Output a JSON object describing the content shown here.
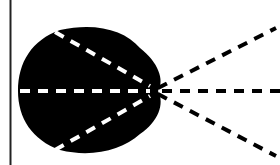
{
  "diagram": {
    "kind": "beam-spread",
    "description": "Black rounded lobe with three white dashed rays converging to a point, continuing as three black dashed rays fanning out to the right; vertical boundary line at left.",
    "colors": {
      "background": "#ffffff",
      "lobe_fill": "#000000",
      "inner_rays": "#ffffff",
      "outer_rays": "#000000",
      "boundary_line": "#222222"
    },
    "boundary_line": {
      "x": 10.5,
      "y1": 0,
      "y2": 165,
      "width": 2
    },
    "focus_point": {
      "x": 155,
      "y": 91
    },
    "lobe": {
      "path": "M 60 30 C 95 22, 125 30, 140 48 C 158 62, 165 80, 158 91 C 165 104, 158 122, 140 134 C 122 150, 92 158, 60 150 C 32 140, 18 118, 18 91 C 18 62, 32 40, 60 30 Z"
    },
    "inner_rays": [
      {
        "name": "inner-ray-upper",
        "x1": 55,
        "y1": 32,
        "x2": 150,
        "y2": 86
      },
      {
        "name": "inner-ray-center",
        "x1": 20,
        "y1": 91,
        "x2": 150,
        "y2": 91
      },
      {
        "name": "inner-ray-lower",
        "x1": 55,
        "y1": 150,
        "x2": 150,
        "y2": 96
      }
    ],
    "outer_rays": [
      {
        "name": "outer-ray-upper",
        "x1": 158,
        "y1": 88,
        "x2": 276,
        "y2": 28
      },
      {
        "name": "outer-ray-center",
        "x1": 162,
        "y1": 91,
        "x2": 280,
        "y2": 91
      },
      {
        "name": "outer-ray-lower",
        "x1": 158,
        "y1": 94,
        "x2": 276,
        "y2": 156
      }
    ],
    "dash_pattern": "10 8",
    "stroke_width": 4
  }
}
